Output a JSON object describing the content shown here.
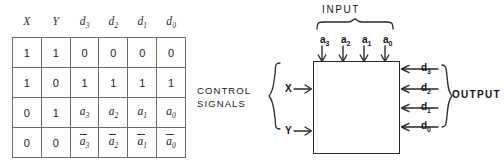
{
  "figure": {
    "kind": "logic-block-diagram-with-truth-table"
  },
  "truth_table": {
    "headers": [
      "X",
      "Y",
      "d",
      "d",
      "d",
      "d"
    ],
    "header_subs": [
      "",
      "",
      "3",
      "2",
      "1",
      "0"
    ],
    "rows": [
      {
        "cells": [
          {
            "text": "1",
            "sub": "",
            "bar": false
          },
          {
            "text": "1",
            "sub": "",
            "bar": false
          },
          {
            "text": "0",
            "sub": "",
            "bar": false
          },
          {
            "text": "0",
            "sub": "",
            "bar": false
          },
          {
            "text": "0",
            "sub": "",
            "bar": false
          },
          {
            "text": "0",
            "sub": "",
            "bar": false
          }
        ]
      },
      {
        "cells": [
          {
            "text": "1",
            "sub": "",
            "bar": false
          },
          {
            "text": "0",
            "sub": "",
            "bar": false
          },
          {
            "text": "1",
            "sub": "",
            "bar": false
          },
          {
            "text": "1",
            "sub": "",
            "bar": false
          },
          {
            "text": "1",
            "sub": "",
            "bar": false
          },
          {
            "text": "1",
            "sub": "",
            "bar": false
          }
        ]
      },
      {
        "cells": [
          {
            "text": "0",
            "sub": "",
            "bar": false
          },
          {
            "text": "1",
            "sub": "",
            "bar": false
          },
          {
            "text": "a",
            "sub": "3",
            "bar": false
          },
          {
            "text": "a",
            "sub": "2",
            "bar": false
          },
          {
            "text": "a",
            "sub": "1",
            "bar": false
          },
          {
            "text": "a",
            "sub": "0",
            "bar": false
          }
        ]
      },
      {
        "cells": [
          {
            "text": "0",
            "sub": "",
            "bar": false
          },
          {
            "text": "0",
            "sub": "",
            "bar": false
          },
          {
            "text": "a",
            "sub": "3",
            "bar": true
          },
          {
            "text": "a",
            "sub": "2",
            "bar": true
          },
          {
            "text": "a",
            "sub": "1",
            "bar": true
          },
          {
            "text": "a",
            "sub": "0",
            "bar": true
          }
        ]
      }
    ]
  },
  "diagram": {
    "control_signals_label_line1": "CONTROL",
    "control_signals_label_line2": "SIGNALS",
    "control_pins": [
      {
        "label": "X"
      },
      {
        "label": "Y"
      }
    ],
    "input_label": "INPUT",
    "input_pins": [
      {
        "base": "a",
        "sub": "3"
      },
      {
        "base": "a",
        "sub": "2"
      },
      {
        "base": "a",
        "sub": "1"
      },
      {
        "base": "a",
        "sub": "0"
      }
    ],
    "output_label": "OUTPUT",
    "output_pins": [
      {
        "base": "d",
        "sub": "3"
      },
      {
        "base": "d",
        "sub": "2"
      },
      {
        "base": "d",
        "sub": "1"
      },
      {
        "base": "d",
        "sub": "0"
      }
    ]
  },
  "colors": {
    "ink": "#2a2a2a",
    "rule": "#6d6d6d",
    "background": "#ffffff"
  }
}
